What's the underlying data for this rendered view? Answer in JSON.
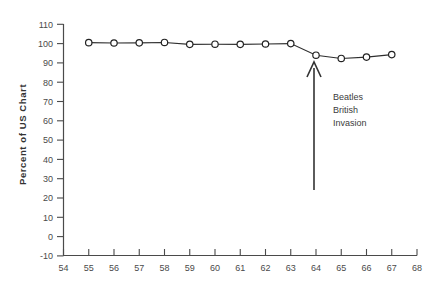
{
  "chart_data": {
    "type": "line",
    "title": "",
    "xlabel": "",
    "ylabel": "Percent of US Chart",
    "xlim": [
      54,
      68
    ],
    "ylim": [
      -10,
      110
    ],
    "xticks": [
      54,
      55,
      56,
      57,
      58,
      59,
      60,
      61,
      62,
      63,
      64,
      65,
      66,
      67,
      68
    ],
    "yticks": [
      -10,
      0,
      10,
      20,
      30,
      40,
      50,
      60,
      70,
      80,
      90,
      100,
      110
    ],
    "grid": false,
    "legend": "none",
    "x": [
      55,
      56,
      57,
      58,
      59,
      60,
      61,
      62,
      63,
      64,
      65,
      66,
      67
    ],
    "values": [
      100.5,
      100.3,
      100.4,
      100.6,
      99.6,
      99.7,
      99.6,
      99.8,
      100.0,
      94.0,
      92.3,
      93.0,
      94.3
    ],
    "series": [
      {
        "name": "Percent of US Chart",
        "values": [
          100.5,
          100.3,
          100.4,
          100.6,
          99.6,
          99.7,
          99.6,
          99.8,
          100.0,
          94.0,
          92.3,
          93.0,
          94.3
        ]
      }
    ],
    "marker": "open-circle",
    "annotations": [
      {
        "name": "beatles-british-invasion",
        "lines": [
          "Beatles",
          "British",
          "Invasion"
        ],
        "arrow": {
          "x": 64,
          "y_from": 38,
          "y_to": 83,
          "direction": "up"
        }
      }
    ],
    "colors": {
      "line": "#2e2e2e",
      "marker_face": "#ffffff",
      "marker_edge": "#222222",
      "axis": "#4a4a4a",
      "text": "#3b3b3b",
      "background": "#ffffff"
    }
  }
}
